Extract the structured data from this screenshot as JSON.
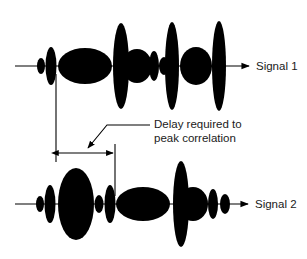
{
  "colors": {
    "ink": "#000000",
    "background": "#ffffff",
    "text": "#1a1a1a"
  },
  "signal1": {
    "label": "Signal 1",
    "baseline_y": 66,
    "line_start_x": 15,
    "arrow_end_x": 249,
    "lobes": [
      {
        "cx": 41,
        "rx": 4,
        "ry": 8
      },
      {
        "cx": 51,
        "rx": 5.5,
        "ry": 19
      },
      {
        "cx": 85,
        "rx": 27,
        "ry": 18
      },
      {
        "cx": 137,
        "rx": 15,
        "ry": 17
      },
      {
        "cx": 154,
        "rx": 5,
        "ry": 15
      },
      {
        "cx": 164,
        "rx": 5,
        "ry": 9
      },
      {
        "cx": 196,
        "rx": 16,
        "ry": 19
      },
      {
        "cx": 121,
        "rx": 8,
        "ry": 43
      },
      {
        "cx": 172,
        "rx": 7,
        "ry": 44
      },
      {
        "cx": 219,
        "rx": 7,
        "ry": 45
      }
    ]
  },
  "signal2": {
    "label": "Signal 2",
    "baseline_y": 204,
    "line_start_x": 15,
    "arrow_end_x": 248,
    "lobes": [
      {
        "cx": 40,
        "rx": 4,
        "ry": 8
      },
      {
        "cx": 50,
        "rx": 5.5,
        "ry": 19
      },
      {
        "cx": 76,
        "rx": 18,
        "ry": 36
      },
      {
        "cx": 99,
        "rx": 4.5,
        "ry": 9
      },
      {
        "cx": 110,
        "rx": 5.5,
        "ry": 19
      },
      {
        "cx": 143,
        "rx": 27,
        "ry": 17
      },
      {
        "cx": 193,
        "rx": 15,
        "ry": 17
      },
      {
        "cx": 213,
        "rx": 5,
        "ry": 15
      },
      {
        "cx": 225,
        "rx": 5,
        "ry": 10
      },
      {
        "cx": 181,
        "rx": 8,
        "ry": 43
      }
    ]
  },
  "annotation": {
    "line1": "Delay required to",
    "line2": "peak correlation",
    "left_marker_x": 56,
    "right_marker_x": 115,
    "dimension_y": 153
  }
}
